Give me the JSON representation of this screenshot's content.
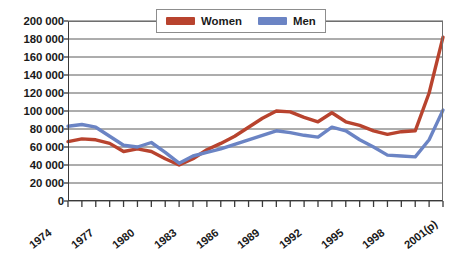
{
  "chart_data": {
    "type": "line",
    "title": "",
    "xlabel": "",
    "ylabel": "",
    "ylim": [
      0,
      200000
    ],
    "ytick_step": 20000,
    "grid": true,
    "grid_orientation": "horizontal",
    "legend_position": "top-center-inside",
    "x": [
      1974,
      1975,
      1976,
      1977,
      1978,
      1979,
      1980,
      1981,
      1982,
      1983,
      1984,
      1985,
      1986,
      1987,
      1988,
      1989,
      1990,
      1991,
      1992,
      1993,
      1994,
      1995,
      1996,
      1997,
      1998,
      1999,
      2000,
      2001
    ],
    "x_tick_labels": [
      "1974",
      "1977",
      "1980",
      "1983",
      "1986",
      "1989",
      "1992",
      "1995",
      "1998",
      "2001(p)"
    ],
    "x_tick_label_years": [
      1974,
      1977,
      1980,
      1983,
      1986,
      1989,
      1992,
      1995,
      1998,
      2001
    ],
    "y_tick_labels": [
      "200 000",
      "180 000",
      "160 000",
      "140 000",
      "120 000",
      "100 000",
      "80 000",
      "60 000",
      "40 000",
      "20 000",
      "0"
    ],
    "y_tick_values": [
      200000,
      180000,
      160000,
      140000,
      120000,
      100000,
      80000,
      60000,
      40000,
      20000,
      0
    ],
    "series": [
      {
        "name": "Women",
        "color": "#B8432E",
        "values": [
          66000,
          69000,
          68000,
          64000,
          55000,
          58000,
          55000,
          47000,
          40000,
          47000,
          57000,
          64000,
          72000,
          82000,
          92000,
          100000,
          99000,
          93000,
          88000,
          98000,
          88000,
          84000,
          78000,
          74000,
          77000,
          78000,
          120000,
          182000
        ]
      },
      {
        "name": "Men",
        "color": "#6B84C4",
        "values": [
          83000,
          85000,
          82000,
          72000,
          62000,
          60000,
          65000,
          54000,
          42000,
          50000,
          54000,
          58000,
          63000,
          68000,
          73000,
          78000,
          76000,
          73000,
          71000,
          82000,
          78000,
          68000,
          60000,
          51000,
          50000,
          49000,
          68000,
          101000
        ]
      }
    ]
  },
  "legend": {
    "entries": [
      {
        "label": "Women",
        "color": "#B8432E",
        "swatch_name": "legend-swatch-women"
      },
      {
        "label": "Men",
        "color": "#6B84C4",
        "swatch_name": "legend-swatch-men"
      }
    ]
  },
  "caption": {
    "text": ""
  }
}
